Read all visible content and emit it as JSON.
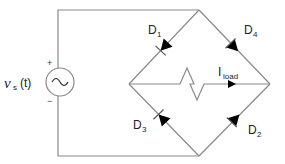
{
  "diagram": {
    "type": "full-wave bridge rectifier",
    "source": {
      "symbol": "v",
      "subscript": "s",
      "argument": "(t)",
      "plus_label": "+",
      "minus_label": "−",
      "glyph": "~"
    },
    "diodes": [
      {
        "id": "D1",
        "letter": "D",
        "index": "1"
      },
      {
        "id": "D2",
        "letter": "D",
        "index": "2"
      },
      {
        "id": "D3",
        "letter": "D",
        "index": "3"
      },
      {
        "id": "D4",
        "letter": "D",
        "index": "4"
      }
    ],
    "load": {
      "current_letter": "I",
      "current_subscript": "load"
    },
    "colors": {
      "wire": "#8a8a8a",
      "diode": "#000000",
      "background": "#ffffff"
    }
  }
}
